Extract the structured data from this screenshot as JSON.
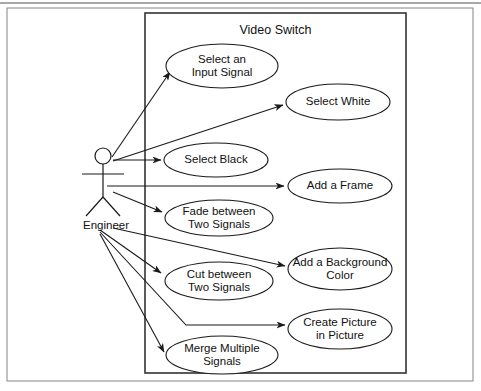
{
  "diagram": {
    "kind": "uml-use-case-diagram",
    "boundary_title": "Video Switch",
    "actor": {
      "name": "Engineer",
      "head": {
        "cx": 103,
        "cy": 156,
        "r": 8
      },
      "body": {
        "x": 103,
        "y_top": 164,
        "y_bottom": 197
      },
      "arms": {
        "x1": 82,
        "x2": 124,
        "y": 174
      },
      "legs": {
        "x_left": 86,
        "x_right": 120,
        "y_foot": 216
      },
      "label_pos": {
        "x": 106,
        "y": 226
      }
    },
    "boundary_box": {
      "x": 145,
      "y": 13,
      "width": 261,
      "height": 360
    },
    "outer_frame": {
      "x": 7,
      "y": 8,
      "width": 466,
      "height": 373
    },
    "top_rule_y": 3,
    "use_cases": [
      {
        "id": "select-an-input-signal",
        "lines": [
          "Select an",
          "Input Signal"
        ],
        "cx": 222,
        "cy": 66,
        "rx": 56,
        "ry": 22
      },
      {
        "id": "select-white",
        "lines": [
          "Select White"
        ],
        "cx": 338,
        "cy": 102,
        "rx": 52,
        "ry": 18
      },
      {
        "id": "select-black",
        "lines": [
          "Select Black"
        ],
        "cx": 216,
        "cy": 160,
        "rx": 52,
        "ry": 17
      },
      {
        "id": "add-a-frame",
        "lines": [
          "Add a Frame"
        ],
        "cx": 340,
        "cy": 186,
        "rx": 52,
        "ry": 17
      },
      {
        "id": "fade-between-two-signals",
        "lines": [
          "Fade between",
          "Two Signals"
        ],
        "cx": 219,
        "cy": 218,
        "rx": 54,
        "ry": 18
      },
      {
        "id": "add-a-background-color",
        "lines": [
          "Add a Background",
          "Color"
        ],
        "cx": 340,
        "cy": 269,
        "rx": 52,
        "ry": 21
      },
      {
        "id": "cut-between-two-signals",
        "lines": [
          "Cut between",
          "Two Signals"
        ],
        "cx": 219,
        "cy": 281,
        "rx": 54,
        "ry": 19
      },
      {
        "id": "create-picture-in-picture",
        "lines": [
          "Create Picture",
          "in Picture"
        ],
        "cx": 340,
        "cy": 329,
        "rx": 52,
        "ry": 20
      },
      {
        "id": "merge-multiple-signals",
        "lines": [
          "Merge Multiple",
          "Signals"
        ],
        "cx": 222,
        "cy": 355,
        "rx": 56,
        "ry": 19
      }
    ],
    "associations": [
      {
        "id": "assoc-select-an-input-signal",
        "target": "select-an-input-signal",
        "path": "M 112 157 L 170 72"
      },
      {
        "id": "assoc-select-white",
        "target": "select-white",
        "path": "M 113 161 L 283 105"
      },
      {
        "id": "assoc-select-black",
        "target": "select-black",
        "path": "M 113 160 L 161 160"
      },
      {
        "id": "assoc-add-a-frame",
        "target": "add-a-frame",
        "path": "M 107 186 L 284 186"
      },
      {
        "id": "assoc-fade-between-two-signals",
        "target": "fade-between-two-signals",
        "path": "M 113 192 L 162 212"
      },
      {
        "id": "assoc-add-a-background-color",
        "target": "add-a-background-color",
        "path": "M 113 228 L 285 266"
      },
      {
        "id": "assoc-cut-between-two-signals",
        "target": "cut-between-two-signals",
        "path": "M 100 230 L 161 273"
      },
      {
        "id": "assoc-create-picture-in-picture",
        "target": "create-picture-in-picture",
        "path": "M 100 232 L 186 325 L 285 325"
      },
      {
        "id": "assoc-merge-multiple-signals",
        "target": "merge-multiple-signals",
        "path": "M 100 234 L 164 352"
      }
    ],
    "colors": {
      "stroke": "#1a1a1a",
      "boundary_stroke": "#333333",
      "frame_stroke": "#8f8f8f",
      "background": "#ffffff",
      "text": "#111111"
    }
  }
}
